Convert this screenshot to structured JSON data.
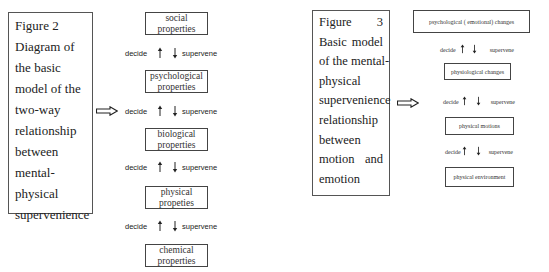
{
  "figure2": {
    "caption_lines": [
      "Figure 2",
      "Diagram of",
      "the basic",
      "model of the",
      "two-way",
      "relationship",
      "between",
      "mental-",
      "physical",
      "supervenience"
    ],
    "levels": [
      {
        "line1": "social",
        "line2": "properties"
      },
      {
        "line1": "psychological",
        "line2": "properties"
      },
      {
        "line1": "biological",
        "line2": "properties"
      },
      {
        "line1": "physical",
        "line2": "propeties"
      },
      {
        "line1": "chemical",
        "line2": "properties"
      }
    ],
    "relation": {
      "up_label": "decide",
      "down_label": "supervene"
    },
    "arrow_icon": "double-right-arrow-icon"
  },
  "figure3": {
    "caption_lines": [
      {
        "left": "Figure",
        "right": "3"
      },
      {
        "left": "Basic",
        "right": "model"
      },
      {
        "left": "of the mental-",
        "right": ""
      },
      {
        "left": "physical",
        "right": ""
      },
      {
        "left": "supervenience",
        "right": ""
      },
      {
        "left": "relationship",
        "right": ""
      },
      {
        "left": "between",
        "right": ""
      },
      {
        "left": "motion",
        "right": "and"
      },
      {
        "left": "emotion",
        "right": ""
      }
    ],
    "levels": [
      "psychological ( emotional) changes",
      "physiological changes",
      "physical motions",
      "physical environment"
    ],
    "relation": {
      "up_label": "decide",
      "down_label": "supervene"
    },
    "arrow_icon": "double-right-arrow-icon"
  }
}
